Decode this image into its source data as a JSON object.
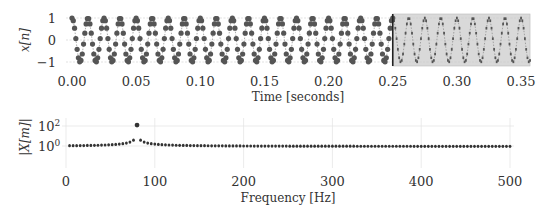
{
  "chart_data": [
    {
      "type": "scatter",
      "title": "",
      "xlabel": "Time [seconds]",
      "ylabel": "x[n]",
      "xlim": [
        0.0,
        0.357
      ],
      "ylim": [
        -1.15,
        1.15
      ],
      "xticks": [
        0.0,
        0.05,
        0.1,
        0.15,
        0.2,
        0.25,
        0.3,
        0.35
      ],
      "xtick_labels": [
        "0.00",
        "0.05",
        "0.10",
        "0.15",
        "0.20",
        "0.25",
        "0.30",
        "0.35"
      ],
      "yticks": [
        1,
        0,
        -1
      ],
      "ytick_labels": [
        "1",
        "0",
        "−1"
      ],
      "grid": true,
      "series": [
        {
          "name": "samples",
          "signal": "cos(2*pi*80*t)",
          "frequency_hz": 80,
          "sample_rate_hz": 1000,
          "t_start": 0.0,
          "t_end": 0.25,
          "marker": "large-dot",
          "color": "#555555"
        },
        {
          "name": "periodic extension",
          "signal": "cos(2*pi*80*t)",
          "frequency_hz": 80,
          "sample_rate_hz": 1000,
          "t_start": 0.25,
          "t_end": 0.357,
          "marker": "small-dot",
          "color": "#555555"
        }
      ],
      "annotations": [
        {
          "type": "shaded-region",
          "x_start": 0.25,
          "x_end": 0.357,
          "color": "#d9d9d9"
        },
        {
          "type": "vertical-line",
          "x": 0.25,
          "color": "#222222"
        }
      ]
    },
    {
      "type": "scatter",
      "title": "",
      "xlabel": "Frequency [Hz]",
      "ylabel": "|X[m]|",
      "yscale": "log",
      "xlim": [
        0,
        500
      ],
      "xticks": [
        0,
        100,
        200,
        300,
        400,
        500
      ],
      "xtick_labels": [
        "0",
        "100",
        "200",
        "300",
        "400",
        "500"
      ],
      "yticks": [
        100,
        1
      ],
      "ytick_labels": [
        "10^2",
        "10^0"
      ],
      "grid": true,
      "series": [
        {
          "name": "DFT magnitude",
          "bin_spacing_hz": 4,
          "f_start": 4,
          "f_end": 500,
          "peak_frequency_hz": 80,
          "peak_value": 125,
          "baseline_value": 1.0,
          "color": "#333333"
        }
      ]
    }
  ],
  "layout": {
    "top": {
      "x0": 72,
      "x_per_unit": 1283,
      "y_one": 18,
      "y_zero": 40,
      "y_neg_one": 62,
      "plot_left": 66,
      "plot_right": 530,
      "plot_top": 14,
      "plot_bottom": 66
    },
    "bottom": {
      "x0": 66,
      "x_per_hz": 0.888,
      "y_1e2": 126,
      "y_1e0": 146,
      "plot_left": 62,
      "plot_right": 514,
      "plot_top": 118,
      "plot_bottom": 168
    }
  },
  "labels": {
    "top_xlabel": "Time [seconds]",
    "bottom_xlabel": "Frequency [Hz]",
    "top_ylabel": "x[n]",
    "bottom_ylabel": "|X[m]|"
  }
}
